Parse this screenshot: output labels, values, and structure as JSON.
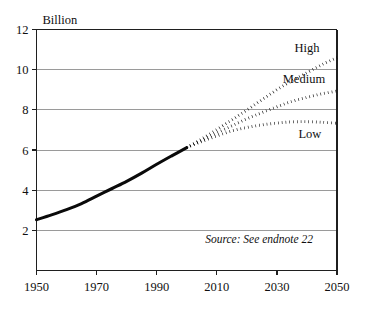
{
  "chart_data": {
    "type": "line",
    "title": "",
    "xlabel": "",
    "ylabel": "Billion",
    "xlim": [
      1950,
      2050
    ],
    "ylim": [
      0,
      12
    ],
    "grid": true,
    "legend_position": "inline-right",
    "xticks": [
      "1950",
      "1970",
      "1990",
      "2010",
      "2030",
      "2050"
    ],
    "xtick_values": [
      1950,
      1970,
      1990,
      2010,
      2030,
      2050
    ],
    "yticks": [
      "2",
      "4",
      "6",
      "8",
      "10",
      "12"
    ],
    "ytick_values": [
      2,
      4,
      6,
      8,
      10,
      12
    ],
    "annotations": [
      {
        "name": "source-note",
        "text": "Source: See endnote 22",
        "x": 2042,
        "y": 1.35
      }
    ],
    "series": [
      {
        "name": "Historical",
        "label": "",
        "style": "solid",
        "x": [
          1950,
          1955,
          1960,
          1965,
          1970,
          1975,
          1980,
          1985,
          1990,
          1995,
          2000
        ],
        "values": [
          2.53,
          2.77,
          3.03,
          3.33,
          3.7,
          4.07,
          4.44,
          4.85,
          5.29,
          5.71,
          6.12
        ]
      },
      {
        "name": "High",
        "label": "High",
        "style": "dotted",
        "label_x": 2040,
        "label_y": 10.9,
        "x": [
          2000,
          2005,
          2010,
          2015,
          2020,
          2025,
          2030,
          2035,
          2040,
          2045,
          2050
        ],
        "values": [
          6.12,
          6.55,
          7.02,
          7.5,
          7.99,
          8.5,
          9.0,
          9.45,
          9.85,
          10.25,
          10.6
        ]
      },
      {
        "name": "Medium",
        "label": "Medium",
        "style": "dotted",
        "label_x": 2039,
        "label_y": 9.35,
        "x": [
          2000,
          2005,
          2010,
          2015,
          2020,
          2025,
          2030,
          2035,
          2040,
          2045,
          2050
        ],
        "values": [
          6.12,
          6.48,
          6.85,
          7.2,
          7.55,
          7.86,
          8.15,
          8.42,
          8.62,
          8.8,
          8.93
        ]
      },
      {
        "name": "Low",
        "label": "Low",
        "style": "dotted",
        "label_x": 2041,
        "label_y": 6.6,
        "x": [
          2000,
          2005,
          2010,
          2015,
          2020,
          2025,
          2030,
          2035,
          2040,
          2045,
          2050
        ],
        "values": [
          6.12,
          6.42,
          6.7,
          6.95,
          7.12,
          7.25,
          7.34,
          7.4,
          7.41,
          7.38,
          7.33
        ]
      }
    ]
  },
  "colors": {
    "line": "#0a0a0a",
    "grid": "#9a9a9a",
    "axis": "#1f1f1f",
    "background": "#ffffff"
  }
}
